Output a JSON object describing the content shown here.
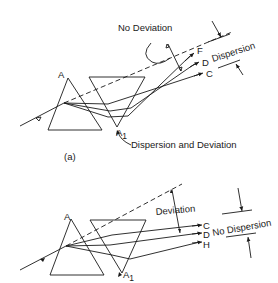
{
  "figure_a": {
    "caption": "(a)",
    "vertex_apex_label": "A",
    "vertex_bottom_label": "A",
    "vertex_bottom_subscript": "1",
    "rays": [
      "F",
      "D",
      "C"
    ],
    "annotation_no_deviation": "No Deviation",
    "annotation_dispersion": "Dispersion",
    "annotation_dispersion_and_deviation": "Dispersion and Deviation"
  },
  "figure_b": {
    "vertex_apex_label": "A",
    "vertex_bottom_label": "A",
    "vertex_bottom_subscript": "1",
    "rays": [
      "C",
      "D",
      "H"
    ],
    "annotation_deviation": "Deviation",
    "annotation_no_dispersion": "No Dispersion"
  },
  "colors": {
    "ink": "#1a1a1a",
    "background": "#ffffff"
  }
}
